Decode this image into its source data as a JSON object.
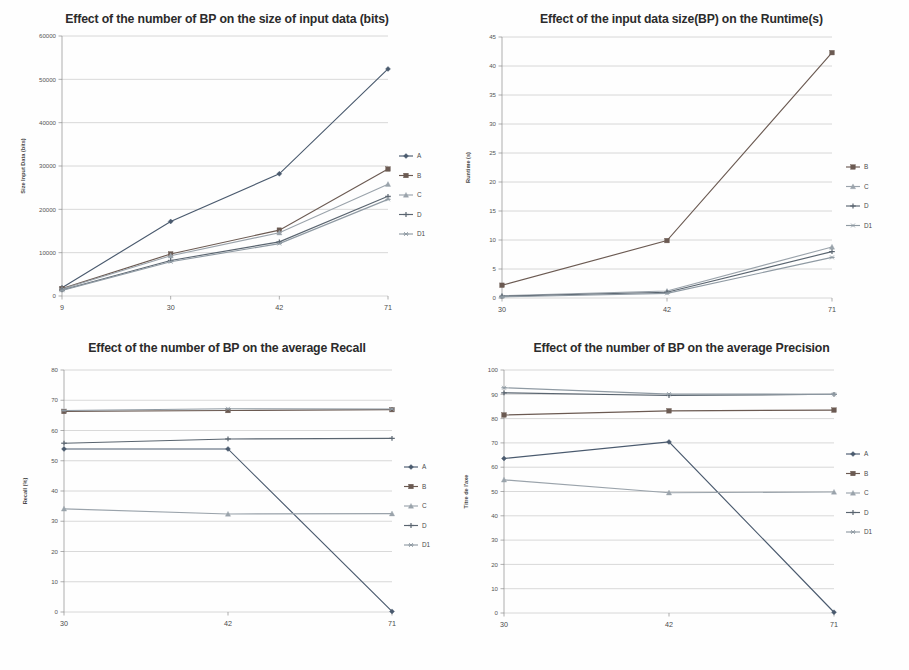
{
  "figure": {
    "name": "four-panel-line-chart-figure",
    "panel_count": 4
  },
  "colors": {
    "A": "#4a5a6e",
    "B": "#6b5a52",
    "C": "#9aa3ab",
    "D": "#5a6570",
    "D1": "#8f9aa3",
    "gridline": "#b9b9b9",
    "axis": "#8e8e8e",
    "title": "#2b2b2b",
    "tick": "#555555"
  },
  "chart_data": [
    {
      "type": "line",
      "id": "chart-input-data-size",
      "title": "Effect of the number of BP on the size of input data (bits)",
      "xlabel": "",
      "ylabel": "Size Input Data (bits)",
      "categories": [
        "9",
        "30",
        "42",
        "71"
      ],
      "x": [
        9,
        30,
        42,
        71
      ],
      "ylim": [
        0,
        60000
      ],
      "yticks": [
        0,
        10000,
        20000,
        30000,
        40000,
        50000,
        60000
      ],
      "ytick_labels": [
        "0",
        "10000",
        "20000",
        "30000",
        "40000",
        "50000",
        "60000"
      ],
      "grid": true,
      "legend_position": "right",
      "series": [
        {
          "name": "A",
          "values": [
            1900,
            17200,
            28200,
            52400
          ],
          "marker": "diamond"
        },
        {
          "name": "B",
          "values": [
            1700,
            9700,
            15200,
            29300
          ],
          "marker": "square"
        },
        {
          "name": "C",
          "values": [
            1600,
            9300,
            14600,
            25800
          ],
          "marker": "triangle"
        },
        {
          "name": "D",
          "values": [
            1400,
            8200,
            12500,
            23000
          ],
          "marker": "cross"
        },
        {
          "name": "D1",
          "values": [
            1300,
            7900,
            12100,
            22300
          ],
          "marker": "star"
        }
      ]
    },
    {
      "type": "line",
      "id": "chart-runtime",
      "title": "Effect of the input data size(BP) on the Runtime(s)",
      "xlabel": "",
      "ylabel": "Runtime (s)",
      "categories": [
        "30",
        "42",
        "71"
      ],
      "x": [
        30,
        42,
        71
      ],
      "ylim": [
        0,
        45
      ],
      "yticks": [
        0,
        5,
        10,
        15,
        20,
        25,
        30,
        35,
        40,
        45
      ],
      "ytick_labels": [
        "0",
        "5",
        "10",
        "15",
        "20",
        "25",
        "30",
        "35",
        "40",
        "45"
      ],
      "grid": true,
      "legend_position": "right",
      "series": [
        {
          "name": "B",
          "values": [
            2.2,
            9.9,
            42.3
          ],
          "marker": "square"
        },
        {
          "name": "C",
          "values": [
            0.4,
            1.2,
            8.8
          ],
          "marker": "triangle"
        },
        {
          "name": "D",
          "values": [
            0.3,
            1.0,
            8.0
          ],
          "marker": "cross"
        },
        {
          "name": "D1",
          "values": [
            0.2,
            0.8,
            7.0
          ],
          "marker": "star"
        }
      ]
    },
    {
      "type": "line",
      "id": "chart-average-recall",
      "title": "Effect of the number of BP on the average Recall",
      "xlabel": "",
      "ylabel": "Recall (%)",
      "categories": [
        "30",
        "42",
        "71"
      ],
      "x": [
        30,
        42,
        71
      ],
      "ylim": [
        0,
        80
      ],
      "yticks": [
        0,
        10,
        20,
        30,
        40,
        50,
        60,
        70,
        80
      ],
      "ytick_labels": [
        "0",
        "10",
        "20",
        "30",
        "40",
        "50",
        "60",
        "70",
        "80"
      ],
      "grid": true,
      "legend_position": "right",
      "series": [
        {
          "name": "A",
          "values": [
            53.9,
            53.9,
            0.2
          ],
          "marker": "diamond"
        },
        {
          "name": "B",
          "values": [
            66.3,
            66.6,
            66.9
          ],
          "marker": "square"
        },
        {
          "name": "C",
          "values": [
            34.1,
            32.4,
            32.5
          ],
          "marker": "triangle"
        },
        {
          "name": "D",
          "values": [
            55.8,
            57.2,
            57.4
          ],
          "marker": "cross"
        },
        {
          "name": "D1",
          "values": [
            66.6,
            67.2,
            67.1
          ],
          "marker": "star"
        }
      ]
    },
    {
      "type": "line",
      "id": "chart-average-precision",
      "title": "Effect of the number of BP on the average Precision",
      "xlabel": "",
      "ylabel": "Titre de l'axe",
      "categories": [
        "30",
        "42",
        "71"
      ],
      "x": [
        30,
        42,
        71
      ],
      "ylim": [
        0,
        100
      ],
      "yticks": [
        0,
        10,
        20,
        30,
        40,
        50,
        60,
        70,
        80,
        90,
        100
      ],
      "ytick_labels": [
        "0",
        "10",
        "20",
        "30",
        "40",
        "50",
        "60",
        "70",
        "80",
        "90",
        "100"
      ],
      "grid": true,
      "legend_position": "right",
      "series": [
        {
          "name": "A",
          "values": [
            63.6,
            70.4,
            0.3
          ],
          "marker": "diamond"
        },
        {
          "name": "B",
          "values": [
            81.5,
            83.2,
            83.5
          ],
          "marker": "square"
        },
        {
          "name": "C",
          "values": [
            54.8,
            49.5,
            49.8
          ],
          "marker": "triangle"
        },
        {
          "name": "D",
          "values": [
            90.6,
            89.5,
            90.0
          ],
          "marker": "cross"
        },
        {
          "name": "D1",
          "values": [
            92.7,
            90.1,
            90.0
          ],
          "marker": "star"
        }
      ]
    }
  ]
}
